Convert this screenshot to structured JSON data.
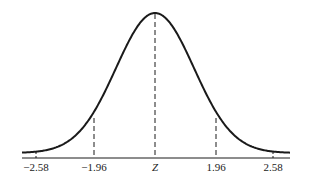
{
  "diagram": {
    "type": "normal-distribution-curve",
    "colors": {
      "stroke": "#1a1a1a",
      "text": "#222222",
      "background": "#ffffff"
    },
    "axis": {
      "center_label": "Z",
      "ticks": [
        {
          "value": -2.58,
          "label": "−2.58",
          "style": "tick"
        },
        {
          "value": -1.96,
          "label": "−1.96",
          "style": "dashed"
        },
        {
          "value": 0,
          "label": "Z",
          "style": "dashed"
        },
        {
          "value": 1.96,
          "label": "1.96",
          "style": "dashed"
        },
        {
          "value": 2.58,
          "label": "2.58",
          "style": "tick"
        }
      ]
    },
    "labels": {
      "neg258": "−2.58",
      "neg196": "−1.96",
      "center": "Z",
      "pos196": "1.96",
      "pos258": "2.58"
    }
  }
}
